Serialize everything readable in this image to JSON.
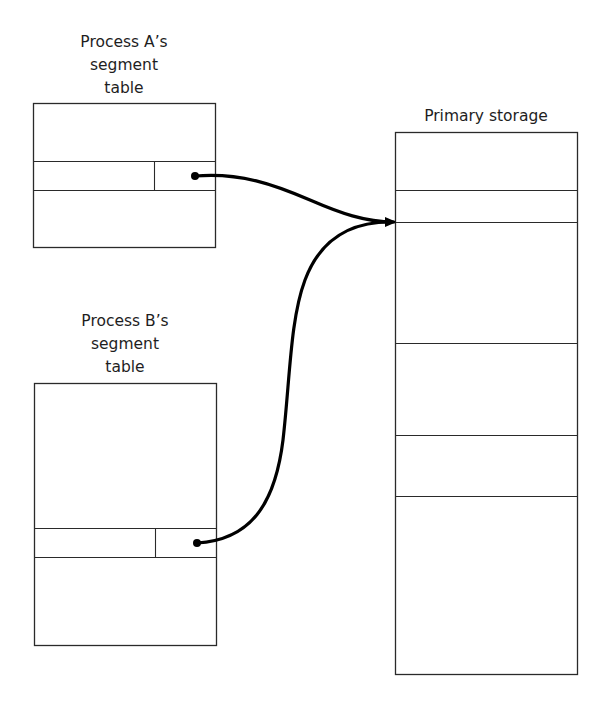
{
  "diagram": {
    "process_a": {
      "label_lines": [
        "Process A’s",
        "segment",
        "table"
      ]
    },
    "process_b": {
      "label_lines": [
        "Process B’s",
        "segment",
        "table"
      ]
    },
    "primary_storage": {
      "label": "Primary storage"
    },
    "edges": [
      {
        "from": "process_a.segment_entry",
        "to": "primary_storage.shared_segment"
      },
      {
        "from": "process_b.segment_entry",
        "to": "primary_storage.shared_segment"
      }
    ],
    "colors": {
      "line": "#2a2a2a",
      "arrow": "#000000",
      "background": "#ffffff"
    }
  }
}
